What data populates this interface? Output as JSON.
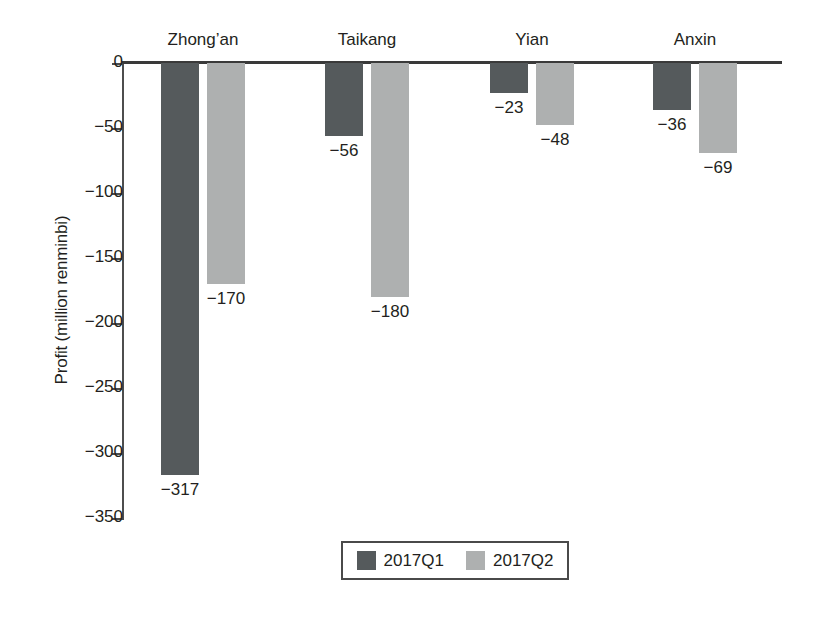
{
  "chart_data": {
    "type": "bar",
    "title": "",
    "xlabel": "",
    "ylabel": "Profit (million renminbi)",
    "categories": [
      "Zhong’an",
      "Taikang",
      "Yian",
      "Anxin"
    ],
    "series": [
      {
        "name": "2017Q1",
        "color": "#555a5c",
        "values": [
          -317,
          -56,
          -23,
          -36
        ],
        "labels": [
          "−317",
          "−56",
          "−23",
          "−36"
        ]
      },
      {
        "name": "2017Q2",
        "color": "#aeb0b0",
        "values": [
          -170,
          -180,
          -48,
          -69
        ],
        "labels": [
          "−170",
          "−180",
          "−48",
          "−69"
        ]
      }
    ],
    "ylim": [
      -350,
      0
    ],
    "ytick_values": [
      0,
      -50,
      -100,
      -150,
      -200,
      -250,
      -300,
      -350
    ],
    "ytick_labels": [
      "0",
      "−50",
      "−100",
      "−150",
      "−200",
      "−250",
      "−300",
      "−350"
    ],
    "grid": false,
    "legend_position": "bottom-center",
    "legend_entries": [
      "2017Q1",
      "2017Q2"
    ],
    "category_label_position": "top"
  },
  "legend": {
    "items": [
      {
        "label": "2017Q1",
        "color": "#555a5c"
      },
      {
        "label": "2017Q2",
        "color": "#aeb0b0"
      }
    ]
  },
  "axis": {
    "y_title": "Profit (million renminbi)"
  },
  "colors": {
    "q1": "#555a5c",
    "q2": "#aeb0b0",
    "axis": "#3a3a3a",
    "text": "#231f20",
    "background": "#ffffff"
  }
}
